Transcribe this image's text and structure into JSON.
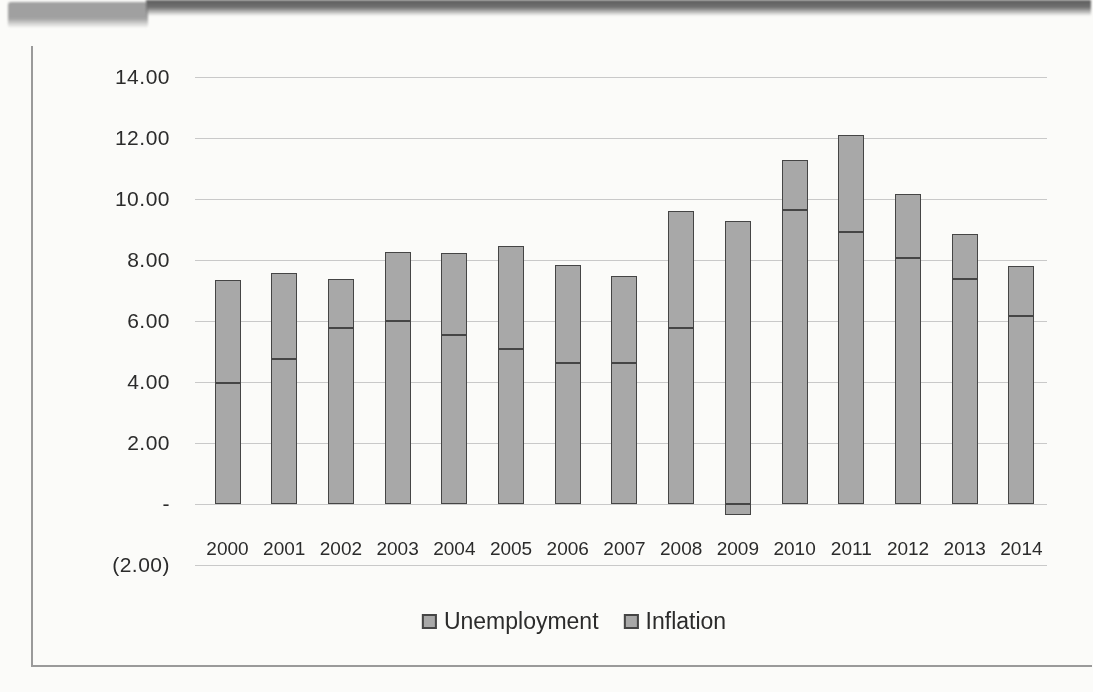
{
  "chart_data": {
    "type": "bar",
    "stacked": true,
    "title": "",
    "xlabel": "",
    "ylabel": "",
    "categories": [
      "2000",
      "2001",
      "2002",
      "2003",
      "2004",
      "2005",
      "2006",
      "2007",
      "2008",
      "2009",
      "2010",
      "2011",
      "2012",
      "2013",
      "2014"
    ],
    "series": [
      {
        "name": "Unemployment",
        "values": [
          3.97,
          4.74,
          5.78,
          5.99,
          5.54,
          5.08,
          4.61,
          4.62,
          5.78,
          9.28,
          9.63,
          8.93,
          8.08,
          7.38,
          6.17
        ]
      },
      {
        "name": "Inflation",
        "values": [
          3.38,
          2.83,
          1.59,
          2.27,
          2.68,
          3.39,
          3.23,
          2.85,
          3.84,
          -0.36,
          1.64,
          3.16,
          2.07,
          1.47,
          1.62
        ]
      }
    ],
    "y_ticks": [
      "14.00",
      "12.00",
      "10.00",
      "8.00",
      "6.00",
      "4.00",
      "2.00",
      "-",
      "(2.00)"
    ],
    "y_tick_values": [
      14,
      12,
      10,
      8,
      6,
      4,
      2,
      0,
      -2
    ],
    "ylim": [
      -2,
      14
    ],
    "grid": true,
    "legend_position": "bottom"
  },
  "colors": {
    "bar_fill": "#a8a8a8",
    "bar_border": "#454545",
    "gridline": "#c9c9c9",
    "text": "#2b2b2b",
    "frame_border": "#9a9a9a",
    "banner_tab": "#a0a0a0",
    "banner_bar": "#5e5e5e",
    "paper": "#fbfbf9"
  }
}
